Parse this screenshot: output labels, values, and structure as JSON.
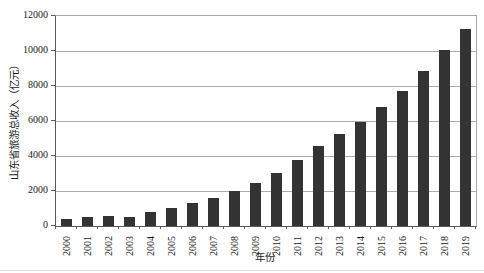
{
  "figure": {
    "background": "#ffffff"
  },
  "chart_data": {
    "type": "bar",
    "title": "",
    "xlabel": "年份",
    "ylabel": "山东省旅游总收入（亿元）",
    "categories": [
      "2000",
      "2001",
      "2002",
      "2003",
      "2004",
      "2005",
      "2006",
      "2007",
      "2008",
      "2009",
      "2010",
      "2011",
      "2012",
      "2013",
      "2014",
      "2015",
      "2016",
      "2017",
      "2018",
      "2019"
    ],
    "values": [
      420,
      500,
      590,
      540,
      810,
      1050,
      1300,
      1620,
      2000,
      2450,
      3040,
      3770,
      4580,
      5250,
      5970,
      6800,
      7720,
      8860,
      10050,
      11250
    ],
    "ylim": [
      0,
      12000
    ],
    "yticks": [
      0,
      2000,
      4000,
      6000,
      8000,
      10000,
      12000
    ],
    "grid": true,
    "legend": "none",
    "bar_color": "#333333",
    "gridline_color": "#ababab",
    "axis_color": "#595959"
  }
}
